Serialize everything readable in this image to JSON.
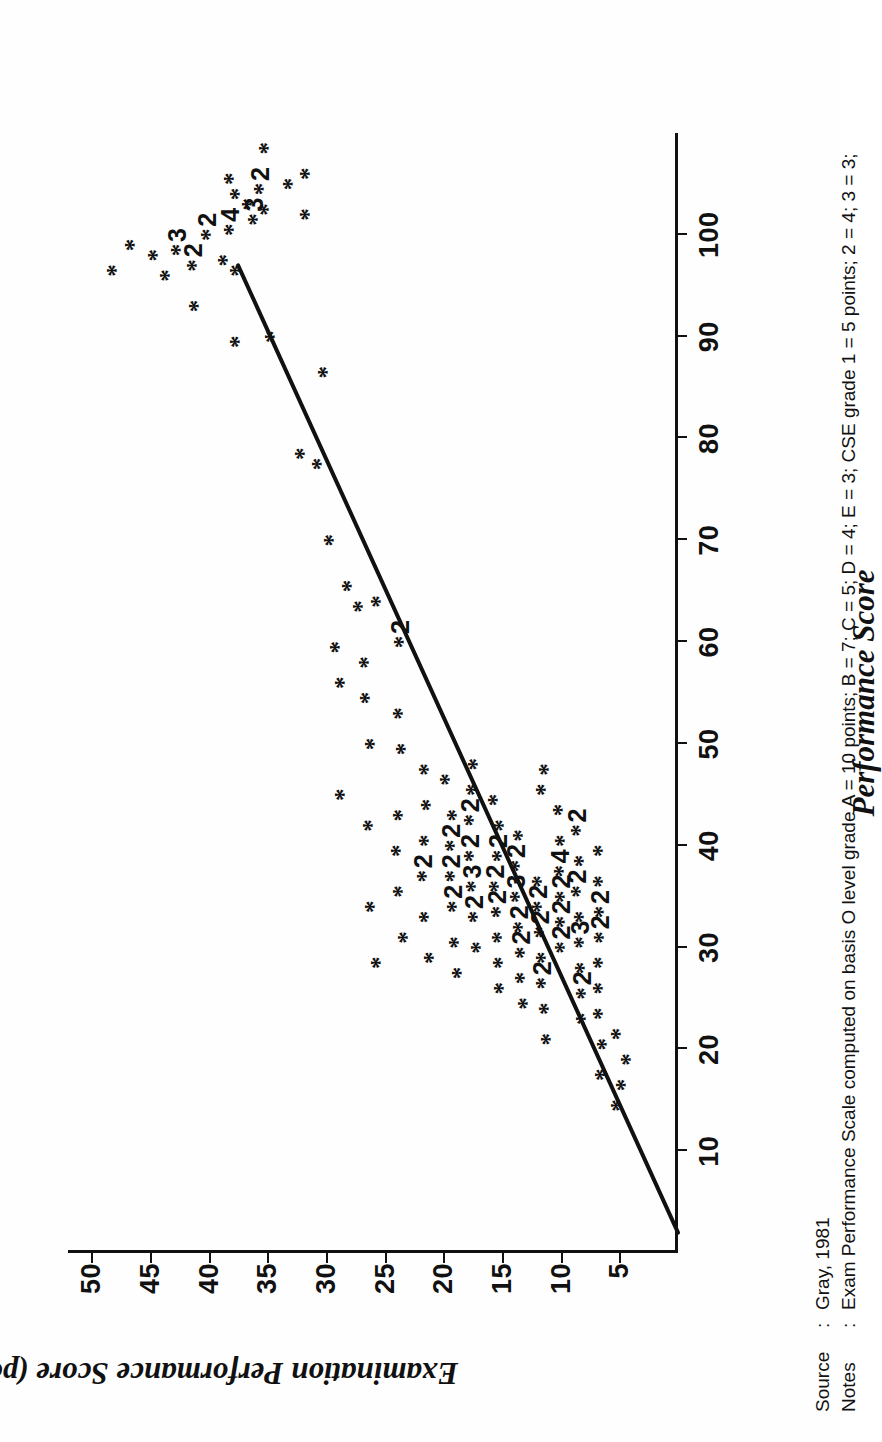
{
  "chart_data": {
    "type": "scatter",
    "title": "Performance Score",
    "xlabel": "Performance Score",
    "ylabel": "Examination Performance Score (points per pupil)",
    "xlim": [
      0,
      110
    ],
    "ylim": [
      0,
      52
    ],
    "xticks": [
      10,
      20,
      30,
      40,
      50,
      60,
      70,
      80,
      90,
      100
    ],
    "yticks": [
      5,
      10,
      15,
      20,
      25,
      30,
      35,
      40,
      45,
      50
    ],
    "grid": false,
    "legend": "none",
    "marker": "*",
    "trendline": {
      "description": "straight regression line drawn through the cloud",
      "x_start": 2,
      "y_start": 0,
      "x_end": 97,
      "y_end": 37.5
    },
    "annotations_note": "digits beside an asterisk give the number of coincident cases at that point",
    "points": [
      {
        "x": 14.5,
        "y": 5.0,
        "n": 1
      },
      {
        "x": 16.5,
        "y": 4.6,
        "n": 1
      },
      {
        "x": 19.0,
        "y": 4.2,
        "n": 1
      },
      {
        "x": 21.5,
        "y": 5.0,
        "n": 1
      },
      {
        "x": 17.5,
        "y": 6.4,
        "n": 1
      },
      {
        "x": 20.5,
        "y": 6.2,
        "n": 1
      },
      {
        "x": 23.5,
        "y": 6.6,
        "n": 1
      },
      {
        "x": 26.0,
        "y": 6.6,
        "n": 1
      },
      {
        "x": 28.5,
        "y": 6.6,
        "n": 1
      },
      {
        "x": 31.0,
        "y": 6.5,
        "n": 2
      },
      {
        "x": 33.5,
        "y": 6.5,
        "n": 2
      },
      {
        "x": 36.5,
        "y": 6.6,
        "n": 1
      },
      {
        "x": 39.5,
        "y": 6.6,
        "n": 1
      },
      {
        "x": 23.0,
        "y": 8.0,
        "n": 1
      },
      {
        "x": 25.5,
        "y": 8.0,
        "n": 2
      },
      {
        "x": 28.0,
        "y": 8.1,
        "n": 1
      },
      {
        "x": 30.5,
        "y": 8.2,
        "n": 3
      },
      {
        "x": 33.0,
        "y": 8.2,
        "n": 1
      },
      {
        "x": 35.5,
        "y": 8.4,
        "n": 2
      },
      {
        "x": 38.5,
        "y": 8.2,
        "n": 1
      },
      {
        "x": 41.5,
        "y": 8.4,
        "n": 2
      },
      {
        "x": 30.0,
        "y": 9.8,
        "n": 2
      },
      {
        "x": 32.5,
        "y": 9.8,
        "n": 2
      },
      {
        "x": 35.0,
        "y": 9.8,
        "n": 2
      },
      {
        "x": 37.5,
        "y": 9.9,
        "n": 4
      },
      {
        "x": 40.5,
        "y": 9.8,
        "n": 1
      },
      {
        "x": 43.5,
        "y": 10.0,
        "n": 1
      },
      {
        "x": 21.0,
        "y": 11.0,
        "n": 1
      },
      {
        "x": 24.0,
        "y": 11.2,
        "n": 1
      },
      {
        "x": 26.5,
        "y": 11.4,
        "n": 2
      },
      {
        "x": 29.0,
        "y": 11.4,
        "n": 1
      },
      {
        "x": 31.5,
        "y": 11.6,
        "n": 2
      },
      {
        "x": 34.0,
        "y": 11.8,
        "n": 2
      },
      {
        "x": 36.5,
        "y": 11.8,
        "n": 1
      },
      {
        "x": 45.5,
        "y": 11.4,
        "n": 1
      },
      {
        "x": 47.5,
        "y": 11.2,
        "n": 1
      },
      {
        "x": 24.5,
        "y": 13.0,
        "n": 1
      },
      {
        "x": 27.0,
        "y": 13.2,
        "n": 1
      },
      {
        "x": 29.5,
        "y": 13.2,
        "n": 2
      },
      {
        "x": 32.0,
        "y": 13.4,
        "n": 2
      },
      {
        "x": 35.0,
        "y": 13.6,
        "n": 3
      },
      {
        "x": 38.0,
        "y": 13.6,
        "n": 2
      },
      {
        "x": 41.0,
        "y": 13.4,
        "n": 1
      },
      {
        "x": 26.0,
        "y": 15.0,
        "n": 1
      },
      {
        "x": 28.5,
        "y": 15.1,
        "n": 1
      },
      {
        "x": 31.0,
        "y": 15.2,
        "n": 1
      },
      {
        "x": 33.5,
        "y": 15.3,
        "n": 2
      },
      {
        "x": 36.0,
        "y": 15.4,
        "n": 2
      },
      {
        "x": 39.0,
        "y": 15.2,
        "n": 2
      },
      {
        "x": 42.0,
        "y": 15.0,
        "n": 1
      },
      {
        "x": 44.5,
        "y": 15.5,
        "n": 1
      },
      {
        "x": 30.0,
        "y": 17.0,
        "n": 1
      },
      {
        "x": 33.0,
        "y": 17.2,
        "n": 2
      },
      {
        "x": 36.0,
        "y": 17.4,
        "n": 3
      },
      {
        "x": 39.0,
        "y": 17.6,
        "n": 2
      },
      {
        "x": 42.5,
        "y": 17.6,
        "n": 2
      },
      {
        "x": 45.5,
        "y": 17.4,
        "n": 1
      },
      {
        "x": 48.0,
        "y": 17.2,
        "n": 1
      },
      {
        "x": 27.5,
        "y": 18.6,
        "n": 1
      },
      {
        "x": 30.5,
        "y": 18.8,
        "n": 1
      },
      {
        "x": 34.0,
        "y": 19.0,
        "n": 2
      },
      {
        "x": 37.0,
        "y": 19.2,
        "n": 2
      },
      {
        "x": 40.0,
        "y": 19.2,
        "n": 2
      },
      {
        "x": 43.0,
        "y": 19.0,
        "n": 1
      },
      {
        "x": 46.5,
        "y": 19.6,
        "n": 1
      },
      {
        "x": 29.0,
        "y": 21.0,
        "n": 1
      },
      {
        "x": 33.0,
        "y": 21.4,
        "n": 1
      },
      {
        "x": 37.0,
        "y": 21.6,
        "n": 2
      },
      {
        "x": 40.5,
        "y": 21.4,
        "n": 1
      },
      {
        "x": 44.0,
        "y": 21.2,
        "n": 1
      },
      {
        "x": 47.5,
        "y": 21.4,
        "n": 1
      },
      {
        "x": 31.0,
        "y": 23.2,
        "n": 1
      },
      {
        "x": 35.5,
        "y": 23.6,
        "n": 1
      },
      {
        "x": 39.5,
        "y": 23.8,
        "n": 1
      },
      {
        "x": 43.0,
        "y": 23.6,
        "n": 1
      },
      {
        "x": 49.5,
        "y": 23.4,
        "n": 1
      },
      {
        "x": 53.0,
        "y": 23.6,
        "n": 1
      },
      {
        "x": 28.5,
        "y": 25.5,
        "n": 1
      },
      {
        "x": 34.0,
        "y": 26.0,
        "n": 1
      },
      {
        "x": 42.0,
        "y": 26.2,
        "n": 1
      },
      {
        "x": 50.0,
        "y": 26.0,
        "n": 1
      },
      {
        "x": 54.5,
        "y": 26.4,
        "n": 1
      },
      {
        "x": 58.0,
        "y": 26.5,
        "n": 1
      },
      {
        "x": 45.0,
        "y": 28.6,
        "n": 1
      },
      {
        "x": 56.0,
        "y": 28.6,
        "n": 1
      },
      {
        "x": 59.5,
        "y": 29.0,
        "n": 1
      },
      {
        "x": 63.5,
        "y": 27.0,
        "n": 1
      },
      {
        "x": 60.0,
        "y": 23.5,
        "n": 2
      },
      {
        "x": 64.0,
        "y": 25.5,
        "n": 1
      },
      {
        "x": 65.5,
        "y": 28.0,
        "n": 1
      },
      {
        "x": 70.0,
        "y": 29.5,
        "n": 1
      },
      {
        "x": 77.5,
        "y": 30.5,
        "n": 1
      },
      {
        "x": 78.5,
        "y": 32.0,
        "n": 1
      },
      {
        "x": 86.5,
        "y": 30.0,
        "n": 1
      },
      {
        "x": 90.0,
        "y": 34.5,
        "n": 1
      },
      {
        "x": 89.5,
        "y": 37.5,
        "n": 1
      },
      {
        "x": 93.0,
        "y": 41.0,
        "n": 1
      },
      {
        "x": 96.5,
        "y": 37.5,
        "n": 1
      },
      {
        "x": 97.5,
        "y": 38.5,
        "n": 1
      },
      {
        "x": 97.0,
        "y": 41.2,
        "n": 2
      },
      {
        "x": 98.5,
        "y": 42.5,
        "n": 3
      },
      {
        "x": 96.0,
        "y": 43.5,
        "n": 1
      },
      {
        "x": 98.0,
        "y": 44.5,
        "n": 1
      },
      {
        "x": 100.5,
        "y": 38.0,
        "n": 4
      },
      {
        "x": 100.0,
        "y": 40.0,
        "n": 2
      },
      {
        "x": 101.5,
        "y": 36.0,
        "n": 3
      },
      {
        "x": 102.5,
        "y": 35.0,
        "n": 1
      },
      {
        "x": 103.0,
        "y": 36.5,
        "n": 1
      },
      {
        "x": 104.0,
        "y": 37.5,
        "n": 1
      },
      {
        "x": 104.5,
        "y": 35.5,
        "n": 2
      },
      {
        "x": 105.5,
        "y": 38.0,
        "n": 1
      },
      {
        "x": 105.0,
        "y": 33.0,
        "n": 1
      },
      {
        "x": 99.0,
        "y": 46.5,
        "n": 1
      },
      {
        "x": 96.5,
        "y": 48.0,
        "n": 1
      },
      {
        "x": 108.5,
        "y": 35.0,
        "n": 1
      },
      {
        "x": 102.0,
        "y": 31.5,
        "n": 1
      },
      {
        "x": 106.0,
        "y": 31.5,
        "n": 1
      }
    ]
  },
  "axes": {
    "x": {
      "title": "Performance Score",
      "ticks": [
        "10",
        "20",
        "30",
        "40",
        "50",
        "60",
        "70",
        "80",
        "90",
        "100"
      ]
    },
    "y": {
      "title": "Examination Performance Score (points per pupil)",
      "ticks": [
        "5",
        "10",
        "15",
        "20",
        "25",
        "30",
        "35",
        "40",
        "45",
        "50"
      ]
    }
  },
  "footer": {
    "source_label": "Source",
    "colon": ":",
    "source_value": "Gray, 1981",
    "notes_label": "Notes",
    "notes_value": "Exam Performance Scale computed on basis O level grade A = 10 points; B = 7; C = 5; D = 4; E = 3; CSE grade 1 = 5 points; 2 = 4; 3 = 3;"
  },
  "colors": {
    "ink": "#111111",
    "paper": "#fefefe"
  }
}
